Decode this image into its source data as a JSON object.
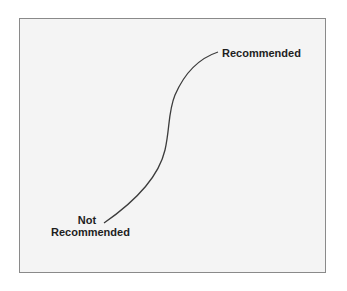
{
  "diagram": {
    "type": "s-curve",
    "top_label": "Recommended",
    "bottom_label_line1": "Not",
    "bottom_label_line2": "Recommended",
    "colors": {
      "background": "#f4f4f4",
      "border": "#8a8a8a",
      "curve": "#3c3c3c",
      "text": "#1e1e1e"
    }
  }
}
